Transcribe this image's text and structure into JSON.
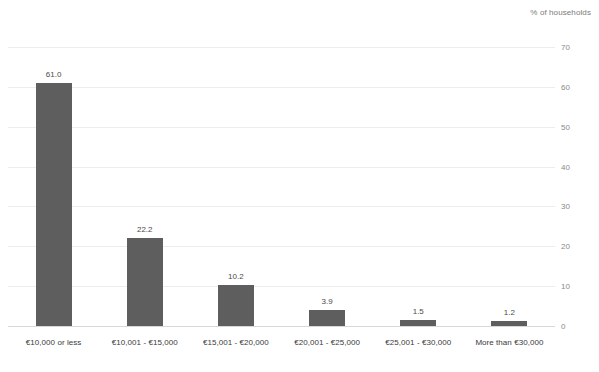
{
  "chart_data": {
    "type": "bar",
    "title": "",
    "subtitle": "",
    "unit_caption": "% of households",
    "xlabel": "",
    "ylabel": "% of households",
    "ylim": [
      0,
      70
    ],
    "y_ticks": [
      0,
      10,
      20,
      30,
      40,
      50,
      60,
      70
    ],
    "y_axis_position": "right",
    "grid": true,
    "legend": false,
    "bar_color": "#5e5e5e",
    "categories": [
      "€10,000 or less",
      "€10,001 - €15,000",
      "€15,001 - €20,000",
      "€20,001 - €25,000",
      "€25,001 - €30,000",
      "More than €30,000"
    ],
    "values": [
      61.0,
      22.2,
      10.2,
      3.9,
      1.5,
      1.2
    ],
    "value_labels": [
      "61.0",
      "22.2",
      "10.2",
      "3.9",
      "1.5",
      "1.2"
    ]
  },
  "axis": {
    "tick_labels": [
      "70",
      "60",
      "50",
      "40",
      "30",
      "20",
      "10",
      "0"
    ]
  },
  "footer": {
    "source_note": ""
  }
}
